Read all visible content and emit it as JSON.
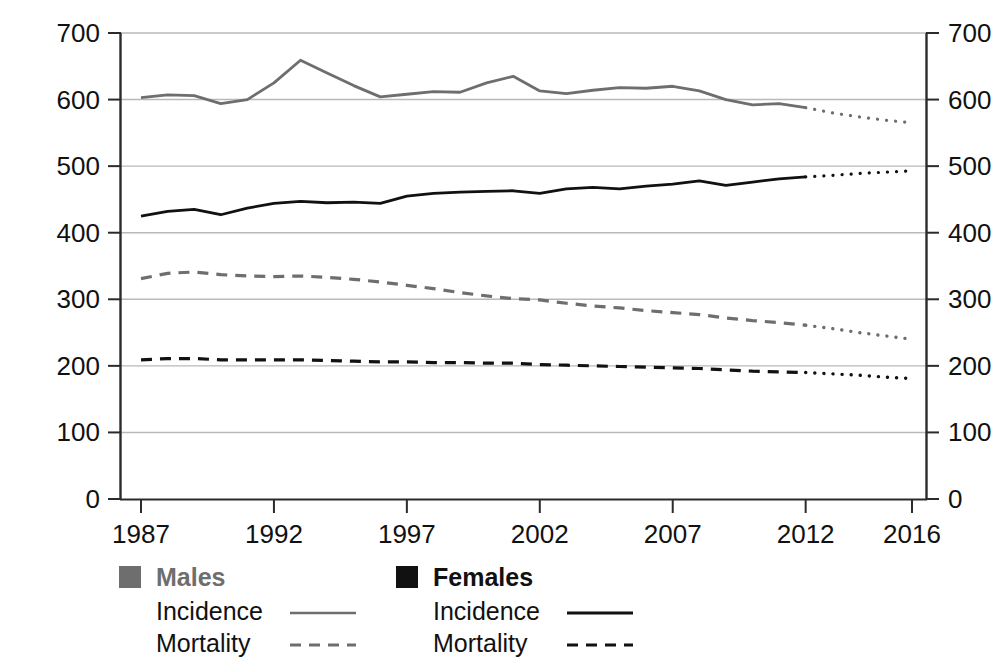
{
  "chart_data": {
    "type": "line",
    "title": "",
    "xlabel": "",
    "ylabel": "Rate (per 100,000)",
    "ylim": [
      0,
      700
    ],
    "xlim": [
      1987,
      2016
    ],
    "yticks": [
      0,
      100,
      200,
      300,
      400,
      500,
      600,
      700
    ],
    "xticks": [
      1987,
      1992,
      1997,
      2002,
      2007,
      2012,
      2016
    ],
    "grid": "horizontal",
    "legend_position": "below",
    "projection_start_year": 2012,
    "x": [
      1987,
      1988,
      1989,
      1990,
      1991,
      1992,
      1993,
      1994,
      1995,
      1996,
      1997,
      1998,
      1999,
      2000,
      2001,
      2002,
      2003,
      2004,
      2005,
      2006,
      2007,
      2008,
      2009,
      2010,
      2011,
      2012,
      2013,
      2014,
      2015,
      2016
    ],
    "series": [
      {
        "name": "Males Incidence",
        "group": "Males",
        "metric": "Incidence",
        "color": "#6e6e6e",
        "style": "solid",
        "values": [
          603,
          607,
          606,
          594,
          600,
          625,
          659,
          640,
          621,
          604,
          608,
          612,
          611,
          625,
          635,
          613,
          609,
          614,
          618,
          617,
          620,
          613,
          600,
          592,
          594,
          588,
          580,
          574,
          569,
          565
        ]
      },
      {
        "name": "Females Incidence",
        "group": "Females",
        "metric": "Incidence",
        "color": "#111111",
        "style": "solid",
        "values": [
          425,
          432,
          435,
          427,
          437,
          444,
          447,
          445,
          446,
          444,
          455,
          459,
          461,
          462,
          463,
          459,
          466,
          468,
          466,
          470,
          473,
          478,
          471,
          476,
          481,
          484,
          486,
          489,
          491,
          493
        ]
      },
      {
        "name": "Males Mortality",
        "group": "Males",
        "metric": "Mortality",
        "color": "#6e6e6e",
        "style": "dashed",
        "values": [
          331,
          339,
          341,
          337,
          335,
          334,
          335,
          333,
          330,
          326,
          321,
          316,
          310,
          305,
          301,
          299,
          294,
          290,
          287,
          283,
          280,
          277,
          272,
          268,
          265,
          261,
          256,
          250,
          245,
          240
        ]
      },
      {
        "name": "Females Mortality",
        "group": "Females",
        "metric": "Mortality",
        "color": "#111111",
        "style": "dashed",
        "values": [
          209,
          211,
          211,
          209,
          209,
          209,
          209,
          208,
          207,
          206,
          206,
          205,
          205,
          204,
          204,
          202,
          201,
          200,
          199,
          198,
          197,
          196,
          194,
          192,
          191,
          190,
          188,
          186,
          183,
          181
        ]
      }
    ],
    "legend": [
      {
        "group_label": "Males",
        "swatch_color": "#6e6e6e",
        "entries": [
          {
            "label": "Incidence",
            "style": "solid",
            "color": "#6e6e6e"
          },
          {
            "label": "Mortality",
            "style": "dashed",
            "color": "#6e6e6e"
          }
        ]
      },
      {
        "group_label": "Females",
        "swatch_color": "#111111",
        "entries": [
          {
            "label": "Incidence",
            "style": "solid",
            "color": "#111111"
          },
          {
            "label": "Mortality",
            "style": "dashed",
            "color": "#111111"
          }
        ]
      }
    ]
  },
  "axes": {
    "y_axis_title": "Rate (per 100,000)",
    "left_ticks": [
      "700",
      "600",
      "500",
      "400",
      "300",
      "200",
      "100",
      "0"
    ],
    "right_ticks": [
      "700",
      "600",
      "500",
      "400",
      "300",
      "200",
      "100",
      "0"
    ],
    "x_ticks": [
      "1987",
      "1992",
      "1997",
      "2002",
      "2007",
      "2012",
      "2016"
    ]
  },
  "legend": {
    "males_title": "Males",
    "females_title": "Females",
    "incidence_label_males": "Incidence",
    "mortality_label_males": "Mortality",
    "incidence_label_females": "Incidence",
    "mortality_label_females": "Mortality"
  },
  "colors": {
    "male": "#6e6e6e",
    "female": "#111111",
    "grid": "#b9b9b9",
    "axis": "#2b2b2b",
    "background": "#ffffff"
  }
}
